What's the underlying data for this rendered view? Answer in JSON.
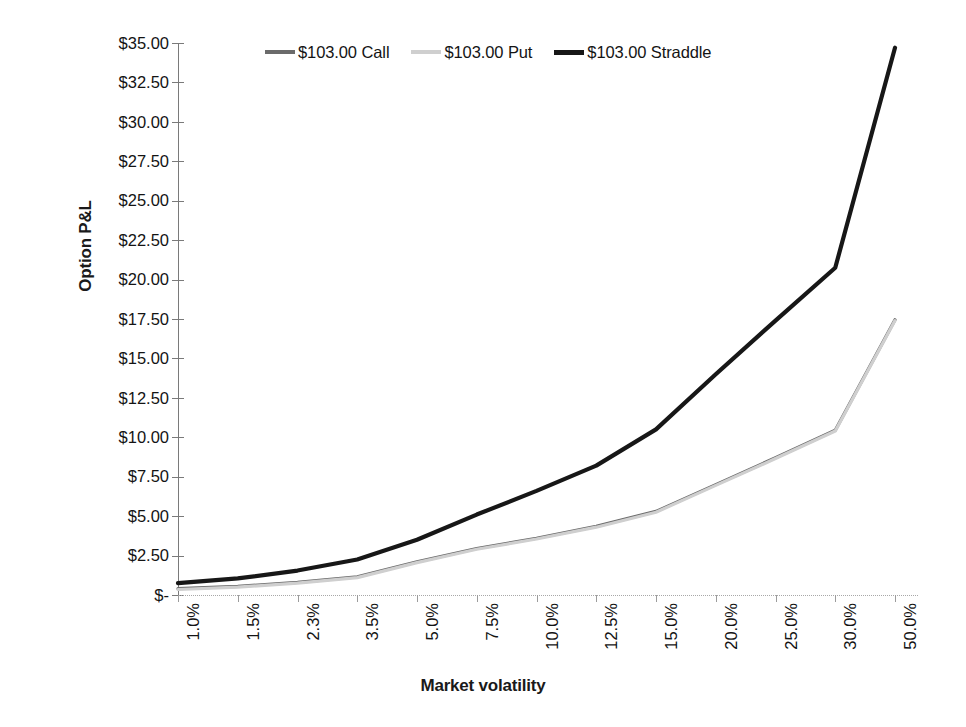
{
  "chart_data": {
    "type": "line",
    "title": "",
    "xlabel": "Market volatility",
    "ylabel": "Option P&L",
    "categories": [
      "1.0%",
      "1.5%",
      "2.3%",
      "3.5%",
      "5.0%",
      "7.5%",
      "10.0%",
      "12.5%",
      "15.0%",
      "20.0%",
      "25.0%",
      "30.0%",
      "50.0%"
    ],
    "ylim": [
      0,
      35
    ],
    "ytick_labels": [
      "$35.00",
      "$32.50",
      "$30.00",
      "$27.50",
      "$25.00",
      "$22.50",
      "$20.00",
      "$17.50",
      "$15.00",
      "$12.50",
      "$10.00",
      "$7.50",
      "$5.00",
      "$2.50",
      "$-"
    ],
    "ytick_values": [
      35,
      32.5,
      30,
      27.5,
      25,
      22.5,
      20,
      17.5,
      15,
      12.5,
      10,
      7.5,
      5,
      2.5,
      0
    ],
    "grid": false,
    "legend_position": "top",
    "series": [
      {
        "name": "$103.00 Call",
        "color": "#6b6b6b",
        "width": 3.2,
        "values": [
          0.4,
          0.55,
          0.8,
          1.15,
          2.1,
          2.95,
          3.6,
          4.35,
          5.3,
          7.0,
          8.7,
          10.45,
          17.45
        ]
      },
      {
        "name": "$103.00 Put",
        "color": "#cfcfcf",
        "width": 3.2,
        "values": [
          0.35,
          0.5,
          0.75,
          1.1,
          2.05,
          2.9,
          3.55,
          4.3,
          5.25,
          6.95,
          8.65,
          10.4,
          17.4
        ]
      },
      {
        "name": "$103.00 Straddle",
        "color": "#171717",
        "width": 4.2,
        "values": [
          0.75,
          1.05,
          1.55,
          2.25,
          3.5,
          5.1,
          6.6,
          8.2,
          10.5,
          14.0,
          17.4,
          20.75,
          34.7
        ]
      }
    ]
  },
  "legend": {
    "items": [
      {
        "label": "$103.00 Call",
        "swatch": "call"
      },
      {
        "label": "$103.00 Put",
        "swatch": "put"
      },
      {
        "label": "$103.00 Straddle",
        "swatch": "straddle"
      }
    ]
  },
  "axes": {
    "y_title": "Option P&L",
    "x_title": "Market volatility"
  }
}
